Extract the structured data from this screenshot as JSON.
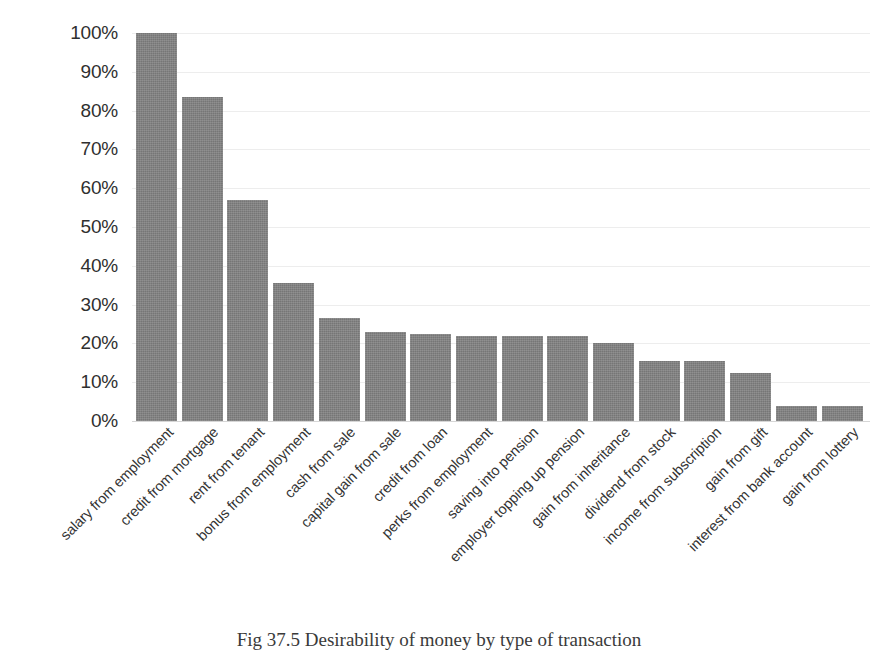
{
  "caption": "Fig 37.5 Desirability of money by type of transaction",
  "style": {
    "bar_color": "#767676",
    "gridline_color": "#ededed",
    "axis_color": "#d6d6d6",
    "text_color": "#2f2f2f",
    "background": "#ffffff"
  },
  "chart_data": {
    "type": "bar",
    "title": "Fig 37.5 Desirability of money by type of transaction",
    "xlabel": "",
    "ylabel": "",
    "ylim": [
      0,
      100
    ],
    "yticks": [
      0,
      10,
      20,
      30,
      40,
      50,
      60,
      70,
      80,
      90,
      100
    ],
    "ytick_labels": [
      "0%",
      "10%",
      "20%",
      "30%",
      "40%",
      "50%",
      "60%",
      "70%",
      "80%",
      "90%",
      "100%"
    ],
    "grid": true,
    "legend": false,
    "orientation": "vertical",
    "value_suffix": "%",
    "categories": [
      "salary from employment",
      "credit from mortgage",
      "rent from tenant",
      "bonus from employment",
      "cash from sale",
      "capital gain from sale",
      "credit from loan",
      "perks from employment",
      "saving into pension",
      "employer topping up pension",
      "gain from inheritance",
      "dividend from stock",
      "income from subscription",
      "gain from gift",
      "interest from bank account",
      "gain from lottery"
    ],
    "values": [
      100,
      83.5,
      57,
      35.5,
      26.5,
      23,
      22.5,
      22,
      22,
      22,
      20,
      15.5,
      15.5,
      12.5,
      3.8,
      3.8
    ]
  }
}
